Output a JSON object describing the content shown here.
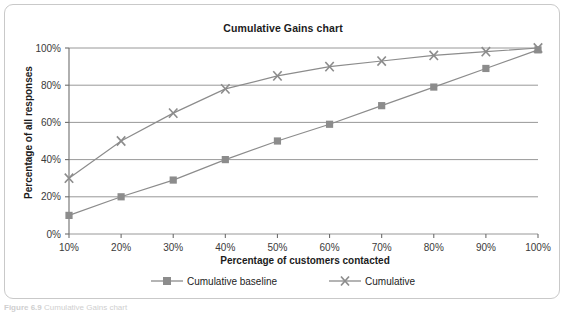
{
  "figure": {
    "caption_number": "Figure 6.9",
    "caption_text": "Cumulative Gains chart"
  },
  "legend": {
    "position": "bottom",
    "items": [
      {
        "label": "Cumulative baseline",
        "marker": "square-marker-icon",
        "color": "#8c8c8c"
      },
      {
        "label": "Cumulative",
        "marker": "x-marker-icon",
        "color": "#8c8c8c"
      }
    ]
  },
  "chart_data": {
    "type": "line",
    "title": "Cumulative Gains chart",
    "xlabel": "Percentage of customers contacted",
    "ylabel": "Percentage of all responses",
    "x": [
      10,
      20,
      30,
      40,
      50,
      60,
      70,
      80,
      90,
      100
    ],
    "categories": [
      "10%",
      "20%",
      "30%",
      "40%",
      "50%",
      "60%",
      "70%",
      "80%",
      "90%",
      "100%"
    ],
    "yticks": [
      0,
      20,
      40,
      60,
      80,
      100
    ],
    "ytick_labels": [
      "0%",
      "20%",
      "40%",
      "60%",
      "80%",
      "100%"
    ],
    "xlim": [
      10,
      100
    ],
    "ylim": [
      0,
      100
    ],
    "grid": "horizontal",
    "legend_position": "bottom",
    "series": [
      {
        "name": "Cumulative baseline",
        "marker": "square",
        "color": "#8c8c8c",
        "values": [
          10,
          20,
          29,
          40,
          50,
          59,
          69,
          79,
          89,
          99
        ]
      },
      {
        "name": "Cumulative",
        "marker": "x",
        "color": "#8c8c8c",
        "values": [
          30,
          50,
          65,
          78,
          85,
          90,
          93,
          96,
          98,
          100
        ]
      }
    ]
  },
  "colors": {
    "line": "#8c8c8c",
    "grid": "#8c8c8c",
    "axis": "#6e6e6e",
    "text": "#1c1c1c",
    "frame_border": "#c9c9c9"
  }
}
